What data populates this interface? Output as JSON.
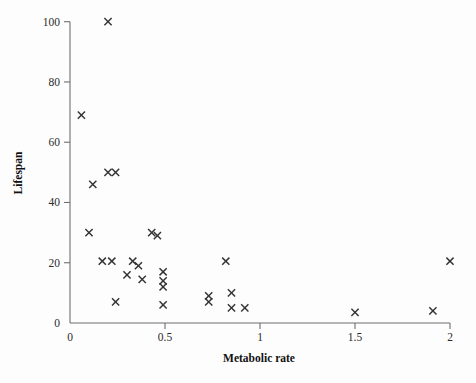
{
  "chart_data": {
    "type": "scatter",
    "title": "",
    "xlabel": "Metabolic rate",
    "ylabel": "Lifespan",
    "xlim": [
      0,
      2.06
    ],
    "ylim": [
      0,
      104
    ],
    "grid": false,
    "legend": null,
    "marker": "x",
    "marker_color": "#333333",
    "xticks": [
      0,
      0.5,
      1,
      1.5,
      2
    ],
    "xtick_labels": [
      "0",
      "0.5",
      "1",
      "1.5",
      "2"
    ],
    "yticks": [
      0,
      20,
      40,
      60,
      80,
      100
    ],
    "ytick_labels": [
      "0",
      "20",
      "40",
      "60",
      "80",
      "100"
    ],
    "points": [
      {
        "x": 0.06,
        "y": 69
      },
      {
        "x": 0.1,
        "y": 30
      },
      {
        "x": 0.12,
        "y": 46
      },
      {
        "x": 0.17,
        "y": 20.5
      },
      {
        "x": 0.2,
        "y": 100
      },
      {
        "x": 0.2,
        "y": 50
      },
      {
        "x": 0.24,
        "y": 50
      },
      {
        "x": 0.22,
        "y": 20.5
      },
      {
        "x": 0.24,
        "y": 7
      },
      {
        "x": 0.3,
        "y": 16
      },
      {
        "x": 0.33,
        "y": 20.5
      },
      {
        "x": 0.36,
        "y": 19
      },
      {
        "x": 0.38,
        "y": 14.5
      },
      {
        "x": 0.43,
        "y": 30
      },
      {
        "x": 0.46,
        "y": 29
      },
      {
        "x": 0.49,
        "y": 17
      },
      {
        "x": 0.49,
        "y": 14
      },
      {
        "x": 0.49,
        "y": 12
      },
      {
        "x": 0.49,
        "y": 6
      },
      {
        "x": 0.73,
        "y": 9
      },
      {
        "x": 0.73,
        "y": 7
      },
      {
        "x": 0.82,
        "y": 20.5
      },
      {
        "x": 0.85,
        "y": 10
      },
      {
        "x": 0.85,
        "y": 5
      },
      {
        "x": 0.92,
        "y": 5
      },
      {
        "x": 1.5,
        "y": 3.5
      },
      {
        "x": 1.91,
        "y": 4
      },
      {
        "x": 2.0,
        "y": 20.5
      }
    ]
  },
  "axes": {
    "x_label": "Metabolic rate",
    "y_label": "Lifespan"
  }
}
